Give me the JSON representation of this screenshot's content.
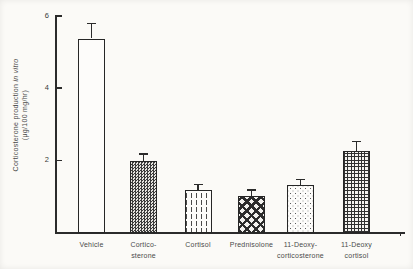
{
  "figure": {
    "background_color": "#fbfaf7",
    "axis_color": "#2b2b2b",
    "text_color": "#4a4a4a"
  },
  "chart_data": {
    "type": "bar",
    "title": "",
    "xlabel": "",
    "ylabel": "Corticosterone production in vitro (μg/100 mg/hr)",
    "ylabel_line1_main": "Corticosterone production ",
    "ylabel_line1_italic": "in vitro",
    "ylabel_line2": "(μg/100 mg/hr)",
    "ylim": [
      0,
      6
    ],
    "yticks": [
      2,
      4,
      6
    ],
    "grid": false,
    "legend": "none",
    "error_bars": true,
    "categories": [
      "Vehicle",
      "Corticosterone",
      "Cortisol",
      "Prednisolone",
      "11-Deoxycorticosterone",
      "11-Deoxycortisol"
    ],
    "bars": [
      {
        "label_lines": [
          "Vehicle"
        ],
        "value": 5.35,
        "error": 0.4,
        "pattern": "open"
      },
      {
        "label_lines": [
          "Cortico-",
          "sterone"
        ],
        "value": 1.95,
        "error": 0.2,
        "pattern": "weave"
      },
      {
        "label_lines": [
          "Cortisol"
        ],
        "value": 1.15,
        "error": 0.15,
        "pattern": "dashed-vertical"
      },
      {
        "label_lines": [
          "Prednisolone"
        ],
        "value": 1.0,
        "error": 0.15,
        "pattern": "diamond-lattice"
      },
      {
        "label_lines": [
          "11-Deoxy-",
          "corticosterone"
        ],
        "value": 1.3,
        "error": 0.15,
        "pattern": "stipple"
      },
      {
        "label_lines": [
          "11-Deoxy",
          "cortisol"
        ],
        "value": 2.25,
        "error": 0.25,
        "pattern": "grid-crosshatch"
      }
    ]
  }
}
